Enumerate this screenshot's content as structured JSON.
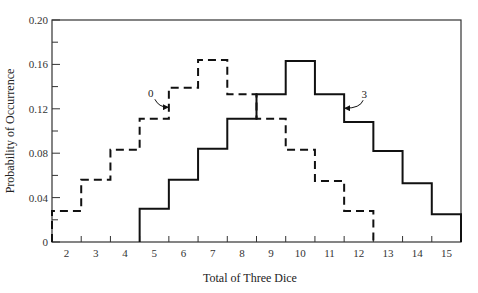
{
  "chart_data": {
    "type": "line",
    "subtype": "step",
    "title": "",
    "xlabel": "Total of Three Dice",
    "ylabel": "Probability of Occurrence",
    "xlim": [
      1.5,
      15.5
    ],
    "ylim": [
      0,
      0.2
    ],
    "x_ticks": [
      2,
      3,
      4,
      5,
      6,
      7,
      8,
      9,
      10,
      11,
      12,
      13,
      14,
      15
    ],
    "y_ticks": [
      0,
      0.04,
      0.08,
      0.12,
      0.16,
      0.2
    ],
    "y_tick_labels": [
      "0",
      "0.04",
      "0.08",
      "0.12",
      "0.16",
      "0.20"
    ],
    "y_minor_ticks": [
      0.02,
      0.06,
      0.1,
      0.14,
      0.18
    ],
    "grid": false,
    "legend": null,
    "series": [
      {
        "name": "0",
        "style": "dashed",
        "x": [
          2,
          3,
          4,
          5,
          6,
          7,
          8,
          9,
          10,
          11,
          12
        ],
        "values": [
          0.028,
          0.056,
          0.083,
          0.111,
          0.139,
          0.164,
          0.133,
          0.111,
          0.083,
          0.055,
          0.028
        ]
      },
      {
        "name": "3",
        "style": "solid",
        "x": [
          5,
          6,
          7,
          8,
          9,
          10,
          11,
          12,
          13,
          14,
          15
        ],
        "values": [
          0.03,
          0.056,
          0.084,
          0.111,
          0.133,
          0.163,
          0.133,
          0.108,
          0.082,
          0.053,
          0.025
        ]
      }
    ],
    "annotations": [
      {
        "text": "0",
        "target_series": "0",
        "target_x": 5.5
      },
      {
        "text": "3",
        "target_series": "3",
        "target_x": 11.5
      }
    ]
  }
}
